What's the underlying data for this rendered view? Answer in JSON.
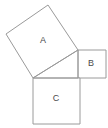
{
  "figure": {
    "background_color": "#ffffff",
    "stroke_color": "#9a9a9a",
    "label_color": "#4a4a4a",
    "width": 108,
    "height": 128
  },
  "labels": {
    "square_a": "A",
    "square_b": "B",
    "square_c": "C"
  },
  "label_positions": {
    "square_a": {
      "x": 43,
      "y": 41
    },
    "square_b": {
      "x": 91,
      "y": 64
    },
    "square_c": {
      "x": 56,
      "y": 99
    }
  },
  "geometry": {
    "triangle": {
      "name": "right-triangle",
      "vertices": [
        {
          "x": 33,
          "y": 78
        },
        {
          "x": 78,
          "y": 50
        },
        {
          "x": 78,
          "y": 78
        }
      ],
      "right_angle_vertex": {
        "x": 78,
        "y": 78
      }
    },
    "square_a": {
      "name": "square-on-hypotenuse",
      "points": "33,78 6,34 48,5 78,50"
    },
    "square_b": {
      "name": "square-on-vertical-leg",
      "points": "78,50 106,50 106,78 78,78"
    },
    "square_c": {
      "name": "square-on-horizontal-leg",
      "points": "33,78 80,78 80,124 33,124"
    }
  }
}
